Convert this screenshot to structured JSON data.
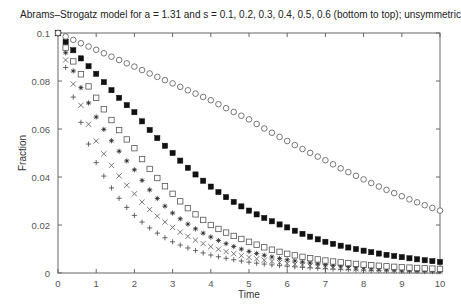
{
  "chart_data": {
    "type": "scatter",
    "title": "Abrams–Strogatz model for a = 1.31 and s = 0.1, 0.2, 0.3, 0.4, 0.5, 0.6 (bottom to top); unsymmetric",
    "xlabel": "Time",
    "ylabel": "Fraction",
    "xlim": [
      0,
      10
    ],
    "ylim": [
      0,
      0.1
    ],
    "xticks": [
      0,
      1,
      2,
      3,
      4,
      5,
      6,
      7,
      8,
      9,
      10
    ],
    "xtick_labels": [
      "0",
      "1",
      "2",
      "3",
      "4",
      "5",
      "6",
      "7",
      "8",
      "9",
      "10"
    ],
    "yticks": [
      0,
      0.02,
      0.04,
      0.06,
      0.08,
      0.1
    ],
    "ytick_labels": [
      "0",
      "0.02",
      "0.04",
      "0.06",
      "0.08",
      "0.1"
    ],
    "grid": false,
    "legend": "none",
    "x": [
      0,
      1,
      2,
      3,
      4,
      5,
      6,
      7,
      8,
      9,
      10
    ],
    "series": [
      {
        "name": "s = 0.1",
        "marker": "plus",
        "values": [
          0.1,
          0.046,
          0.024,
          0.013,
          0.0075,
          0.0045,
          0.0028,
          0.0018,
          0.0012,
          0.0008,
          0.0005
        ]
      },
      {
        "name": "s = 0.2",
        "marker": "cross",
        "values": [
          0.1,
          0.055,
          0.033,
          0.019,
          0.011,
          0.0065,
          0.004,
          0.0025,
          0.0016,
          0.001,
          0.0007
        ]
      },
      {
        "name": "s = 0.3",
        "marker": "star",
        "values": [
          0.1,
          0.065,
          0.043,
          0.025,
          0.015,
          0.009,
          0.0055,
          0.0035,
          0.0023,
          0.0015,
          0.001
        ]
      },
      {
        "name": "s = 0.4",
        "marker": "open-square",
        "values": [
          0.1,
          0.073,
          0.052,
          0.033,
          0.02,
          0.013,
          0.008,
          0.0052,
          0.0035,
          0.0024,
          0.0017
        ]
      },
      {
        "name": "s = 0.5",
        "marker": "filled-square",
        "values": [
          0.1,
          0.083,
          0.067,
          0.05,
          0.036,
          0.026,
          0.019,
          0.013,
          0.0093,
          0.0066,
          0.0046
        ]
      },
      {
        "name": "s = 0.6",
        "marker": "open-circle",
        "values": [
          0.1,
          0.093,
          0.086,
          0.079,
          0.072,
          0.064,
          0.055,
          0.047,
          0.039,
          0.032,
          0.026
        ]
      }
    ],
    "marker_step": 0.2
  }
}
